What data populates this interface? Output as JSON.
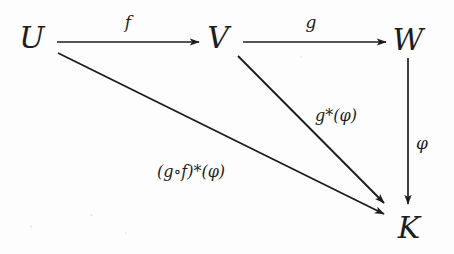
{
  "figure": {
    "kind": "commutative-diagram",
    "background_color": "#fdfdfd",
    "ink_color": "#1d1d1d",
    "nodes": [
      {
        "id": "U",
        "label": "U",
        "x": 32,
        "y": 38
      },
      {
        "id": "V",
        "label": "V",
        "x": 218,
        "y": 38
      },
      {
        "id": "W",
        "label": "W",
        "x": 408,
        "y": 40
      },
      {
        "id": "K",
        "label": "K",
        "x": 409,
        "y": 228
      }
    ],
    "edges": [
      {
        "id": "f",
        "label": "f",
        "from": "U",
        "to": "V",
        "label_x": 128,
        "label_y": 22,
        "x1": 57,
        "y1": 42,
        "x2": 199,
        "y2": 42
      },
      {
        "id": "g",
        "label": "g",
        "from": "V",
        "to": "W",
        "label_x": 311,
        "label_y": 22,
        "x1": 243,
        "y1": 42,
        "x2": 386,
        "y2": 42
      },
      {
        "id": "phi",
        "label": "φ",
        "from": "W",
        "to": "K",
        "label_x": 422,
        "label_y": 143,
        "x1": 408,
        "y1": 58,
        "x2": 408,
        "y2": 204
      },
      {
        "id": "g-star-phi",
        "label": "g*(φ)",
        "from": "V",
        "to": "K",
        "label_x": 336,
        "label_y": 116,
        "x1": 238,
        "y1": 56,
        "x2": 384,
        "y2": 203
      },
      {
        "id": "gof-star-phi",
        "label": "(g∘f)*(φ)",
        "from": "U",
        "to": "K",
        "label_x": 191,
        "label_y": 172,
        "x1": 58,
        "y1": 53,
        "x2": 384,
        "y2": 214
      }
    ]
  }
}
